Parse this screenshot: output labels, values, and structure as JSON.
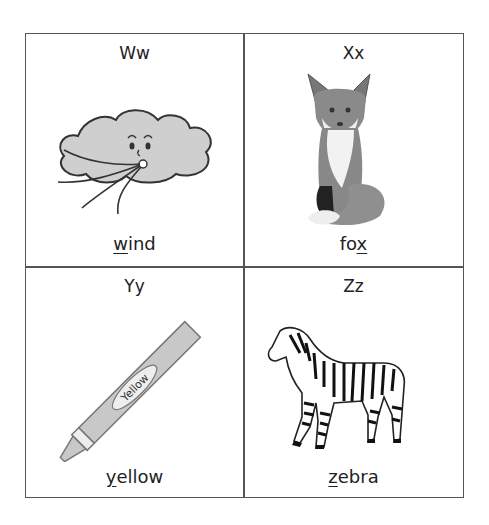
{
  "worksheet": {
    "cells": [
      {
        "letter": "Ww",
        "word_first": "w",
        "word_rest": "ind",
        "picture": "wind-cloud"
      },
      {
        "letter": "Xx",
        "word_first": "fo",
        "word_rest": "x",
        "picture": "fox"
      },
      {
        "letter": "Yy",
        "word_first": "y",
        "word_rest": "ellow",
        "picture": "crayon",
        "crayon_label": "Yellow"
      },
      {
        "letter": "Zz",
        "word_first": "z",
        "word_rest": "ebra",
        "picture": "zebra"
      }
    ]
  }
}
